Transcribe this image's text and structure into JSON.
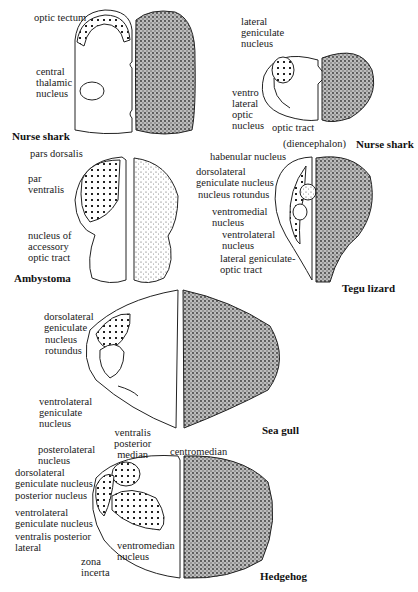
{
  "figure": {
    "panels": [
      {
        "species": "Nurse shark",
        "labels": [
          "optic tectum",
          "central\nthalamic\nnucleus"
        ]
      },
      {
        "species": "Nurse shark",
        "subtitle": "(diencephalon)",
        "labels": [
          "lateral\ngeniculate\nnucleus",
          "ventro\nlateral\noptic\nnucleus",
          "optic tract"
        ]
      },
      {
        "species": "Ambystoma",
        "labels": [
          "pars dorsalis",
          "par\nventralis",
          "nucleus of\naccessory\noptic tract"
        ]
      },
      {
        "species": "Tegu lizard",
        "labels": [
          "habenular nucleus",
          "dorsolateral\ngeniculate nucleus",
          "nucleus rotundus",
          "ventromedial\nnucleus",
          "ventrolateral\nnucleus",
          "lateral geniculate-\noptic tract"
        ]
      },
      {
        "species": "Sea gull",
        "labels": [
          "dorsolateral\ngeniculate",
          "nucleus\nrotundus",
          "ventrolateral\ngeniculate\nnucleus"
        ]
      },
      {
        "species": "Hedgehog",
        "labels": [
          "ventralis\nposterior\nmedian",
          "centromedian",
          "posterolateral\nnucleus",
          "dorsolateral\ngeniculate nucleus",
          "posterior nucleus",
          "ventrolateral\ngeniculate nucleus",
          "ventralis posterior\nlateral",
          "zona\nincerta",
          "ventromedian\nnucleus"
        ]
      }
    ]
  }
}
